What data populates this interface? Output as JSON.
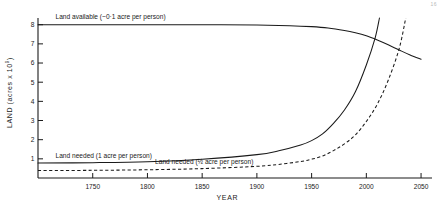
{
  "figure": {
    "corner_mark": "16",
    "background": "#ffffff",
    "ink_color": "#1a1a1a"
  },
  "chart_data": {
    "type": "line",
    "title": "",
    "xlabel": "YEAR",
    "ylabel": "LAND (acres x 10⁹)",
    "ylabel_main": "LAND (acres x 10",
    "ylabel_exp": "9",
    "ylabel_close": ")",
    "xlim": [
      1700,
      2060
    ],
    "ylim": [
      0,
      8.35
    ],
    "grid": false,
    "legend_position": "inline-annotations",
    "xticks": [
      1750,
      1800,
      1850,
      1900,
      1950,
      2000,
      2050
    ],
    "xtick_labels": [
      "1750",
      "1800",
      "1850",
      "1900",
      "1950",
      "2000",
      "2050"
    ],
    "yticks": [
      1,
      2,
      3,
      4,
      5,
      6,
      7,
      8
    ],
    "ytick_labels": [
      "1",
      "2",
      "3",
      "4",
      "5",
      "6",
      "7",
      "8"
    ],
    "annotations": [
      {
        "name": "land-available-label",
        "text": "Land available (~0·1 acre per person)",
        "x": 1716,
        "y": 8.32
      },
      {
        "name": "land-needed-1acre-label",
        "text": "Land needed (1 acre per person)",
        "x": 1716,
        "y": 1.02
      },
      {
        "name": "land-needed-half-acre-label",
        "text": "Land needed (½ acre per person)",
        "x": 1807,
        "y": 0.72
      }
    ],
    "series": [
      {
        "name": "Land available (~0·1 acre per person)",
        "style": "solid",
        "x": [
          1700,
          1750,
          1800,
          1850,
          1900,
          1930,
          1950,
          1965,
          1980,
          1990,
          2000,
          2010,
          2020,
          2030,
          2040,
          2050
        ],
        "values": [
          8.0,
          8.0,
          8.0,
          8.0,
          7.98,
          7.95,
          7.9,
          7.83,
          7.7,
          7.58,
          7.42,
          7.2,
          6.95,
          6.68,
          6.42,
          6.2
        ]
      },
      {
        "name": "Land needed (1 acre per person)",
        "style": "solid",
        "x": [
          1700,
          1750,
          1800,
          1850,
          1900,
          1920,
          1940,
          1950,
          1960,
          1970,
          1980,
          1990,
          2000,
          2008,
          2012
        ],
        "values": [
          0.78,
          0.8,
          0.85,
          0.98,
          1.22,
          1.42,
          1.72,
          1.95,
          2.3,
          2.85,
          3.55,
          4.5,
          5.9,
          7.3,
          8.35
        ]
      },
      {
        "name": "Land needed (½ acre per person)",
        "style": "dashed",
        "x": [
          1700,
          1750,
          1800,
          1850,
          1900,
          1920,
          1940,
          1950,
          1960,
          1970,
          1980,
          1990,
          2000,
          2010,
          2020,
          2030,
          2036
        ],
        "values": [
          0.39,
          0.4,
          0.43,
          0.49,
          0.61,
          0.71,
          0.86,
          0.98,
          1.15,
          1.43,
          1.78,
          2.25,
          2.95,
          3.85,
          5.1,
          6.75,
          8.35
        ]
      }
    ],
    "crossings": [
      {
        "name": "1-acre-crosses-available",
        "year": 2008,
        "value": 7.3
      },
      {
        "name": "half-acre-crosses-available",
        "year": 2033,
        "value": 6.8
      }
    ]
  }
}
